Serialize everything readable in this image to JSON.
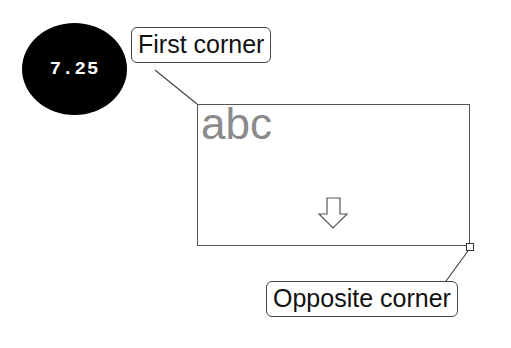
{
  "step": {
    "number": "7.25"
  },
  "callouts": {
    "first_corner": "First corner",
    "opposite_corner": "Opposite corner"
  },
  "rectangle": {
    "content_text": "abc",
    "content_color": "#8a8a8a",
    "drag_direction_icon": "down-arrow-icon"
  }
}
